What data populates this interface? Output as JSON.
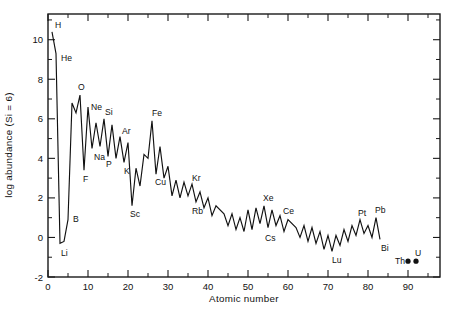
{
  "figure": {
    "background_color": "#ffffff",
    "ink_color": "#111111"
  },
  "chart_data": {
    "type": "line",
    "title": "",
    "subtitle": "",
    "xlabel": "Atomic number",
    "ylabel": "log abundance (Si = 6)",
    "xlim": [
      0,
      98
    ],
    "ylim": [
      -2,
      11.3
    ],
    "grid": false,
    "legend": null,
    "x_major_ticks": [
      0,
      10,
      20,
      30,
      40,
      50,
      60,
      70,
      80,
      90
    ],
    "x_major_tick_labels": [
      "0",
      "10",
      "20",
      "30",
      "40",
      "50",
      "60",
      "70",
      "80",
      "90"
    ],
    "x_minor_ticks": [
      5,
      15,
      25,
      35,
      45,
      55,
      65,
      75,
      85,
      95
    ],
    "y_major_ticks": [
      -2,
      0,
      2,
      4,
      6,
      8,
      10
    ],
    "y_major_tick_labels": [
      "-2",
      "0",
      "2",
      "4",
      "6",
      "8",
      "10"
    ],
    "y_minor_ticks": [
      -1,
      1,
      3,
      5,
      7,
      9,
      11
    ],
    "series": [
      {
        "name": "Solar system abundance",
        "mode": "line",
        "x": [
          1,
          2,
          3,
          4,
          5,
          6,
          7,
          8,
          9,
          10,
          11,
          12,
          13,
          14,
          15,
          16,
          17,
          18,
          19,
          20,
          21,
          22,
          23,
          24,
          25,
          26,
          27,
          28,
          29,
          30,
          31,
          32,
          33,
          34,
          35,
          36,
          37,
          38,
          39,
          40,
          41,
          42,
          44,
          45,
          46,
          47,
          48,
          49,
          50,
          51,
          52,
          53,
          54,
          55,
          56,
          57,
          58,
          59,
          60,
          62,
          63,
          64,
          65,
          66,
          67,
          68,
          69,
          70,
          71,
          72,
          73,
          74,
          75,
          76,
          77,
          78,
          79,
          80,
          81,
          82,
          83
        ],
        "values": [
          10.4,
          9.3,
          -0.3,
          -0.2,
          0.9,
          6.8,
          6.3,
          7.2,
          3.4,
          6.6,
          4.5,
          5.8,
          4.6,
          6.0,
          4.1,
          5.7,
          4.0,
          5.1,
          3.8,
          4.8,
          1.6,
          3.5,
          2.6,
          4.2,
          4.0,
          5.9,
          3.2,
          4.6,
          3.0,
          3.6,
          2.1,
          2.9,
          2.0,
          2.8,
          2.1,
          2.7,
          1.8,
          2.3,
          1.5,
          2.0,
          1.1,
          1.6,
          1.2,
          0.6,
          1.2,
          0.4,
          1.0,
          0.3,
          1.4,
          0.4,
          1.5,
          0.7,
          1.6,
          0.5,
          1.4,
          0.6,
          1.1,
          0.3,
          0.9,
          0.5,
          0.0,
          0.6,
          -0.2,
          0.5,
          -0.3,
          0.3,
          -0.6,
          0.1,
          -0.7,
          0.1,
          -0.4,
          0.4,
          -0.2,
          0.6,
          0.1,
          0.9,
          0.2,
          0.6,
          0.0,
          1.0,
          -0.1
        ]
      }
    ],
    "points": [
      {
        "label": "Th",
        "x": 90,
        "y": -1.2
      },
      {
        "label": "U",
        "x": 92,
        "y": -1.2
      }
    ],
    "annotations": [
      {
        "text": "H",
        "x": 1,
        "y": 10.4
      },
      {
        "text": "He",
        "x": 2,
        "y": 9.3
      },
      {
        "text": "Li",
        "x": 3,
        "y": -0.3
      },
      {
        "text": "B",
        "x": 5,
        "y": 0.9
      },
      {
        "text": "O",
        "x": 8,
        "y": 7.2
      },
      {
        "text": "F",
        "x": 9,
        "y": 3.4
      },
      {
        "text": "Ne",
        "x": 10,
        "y": 6.6
      },
      {
        "text": "Na",
        "x": 11,
        "y": 4.5
      },
      {
        "text": "Si",
        "x": 14,
        "y": 6.0
      },
      {
        "text": "P",
        "x": 15,
        "y": 4.1
      },
      {
        "text": "Ar",
        "x": 18,
        "y": 5.1
      },
      {
        "text": "K",
        "x": 19,
        "y": 3.8
      },
      {
        "text": "Sc",
        "x": 21,
        "y": 1.6
      },
      {
        "text": "Fe",
        "x": 26,
        "y": 5.9
      },
      {
        "text": "Cu",
        "x": 29,
        "y": 3.0
      },
      {
        "text": "Kr",
        "x": 36,
        "y": 2.7
      },
      {
        "text": "Rb",
        "x": 37,
        "y": 1.8
      },
      {
        "text": "Xe",
        "x": 54,
        "y": 1.6
      },
      {
        "text": "Cs",
        "x": 55,
        "y": 0.5
      },
      {
        "text": "Ce",
        "x": 58,
        "y": 1.1
      },
      {
        "text": "Lu",
        "x": 71,
        "y": -0.7
      },
      {
        "text": "Pt",
        "x": 78,
        "y": 0.9
      },
      {
        "text": "Pb",
        "x": 82,
        "y": 1.0
      },
      {
        "text": "Bi",
        "x": 83,
        "y": -0.1
      },
      {
        "text": "Th",
        "x": 90,
        "y": -1.2
      },
      {
        "text": "U",
        "x": 92,
        "y": -1.2
      }
    ]
  }
}
